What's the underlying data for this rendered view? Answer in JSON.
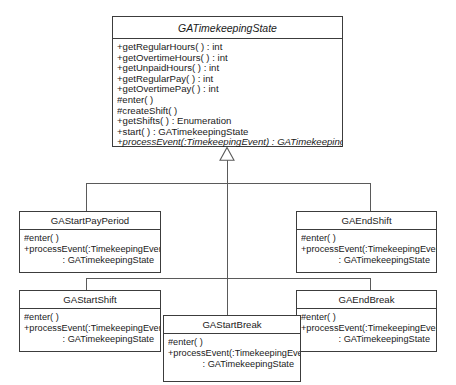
{
  "diagram": {
    "type": "uml-class-diagram",
    "relationship": "generalization",
    "arrowhead": "hollow-triangle"
  },
  "classes": {
    "root": {
      "name": "GATimekeepingState",
      "abstract": true,
      "members": [
        "+getRegularHours( ) : int",
        "+getOvertimeHours( ) : int",
        "+getUnpaidHours( ) : int",
        "+getRegularPay( ) : int",
        "+getOvertimePay( ) : int",
        "#enter( )",
        "#createShift( )",
        "+getShifts( ) : Enumeration",
        "+start( ) : GATimekeepingState",
        "+processEvent(:TimekeepingEvent) : GATimekeepingState"
      ]
    },
    "startPayPeriod": {
      "name": "GAStartPayPeriod",
      "m0": "#enter( )",
      "m1": "+processEvent(:TimekeepingEvent)",
      "m2": ": GATimekeepingState"
    },
    "endShift": {
      "name": "GAEndShift",
      "m0": "#enter( )",
      "m1": "+processEvent(:TimekeepingEvent)",
      "m2": ": GATimekeepingState"
    },
    "startShift": {
      "name": "GAStartShift",
      "m0": "#enter( )",
      "m1": "+processEvent(:TimekeepingEvent)",
      "m2": ": GATimekeepingState"
    },
    "endBreak": {
      "name": "GAEndBreak",
      "m0": "#enter( )",
      "m1": "+processEvent(:TimekeepingEvent)",
      "m2": ": GATimekeepingState"
    },
    "startBreak": {
      "name": "GAStartBreak",
      "m0": "#enter( )",
      "m1": "+processEvent(:TimekeepingEvent)",
      "m2": ": GATimekeepingState"
    }
  },
  "colors": {
    "border": "#3c3c3c",
    "line": "#5a5a5a",
    "text": "#1a1a1a",
    "background": "#ffffff"
  }
}
